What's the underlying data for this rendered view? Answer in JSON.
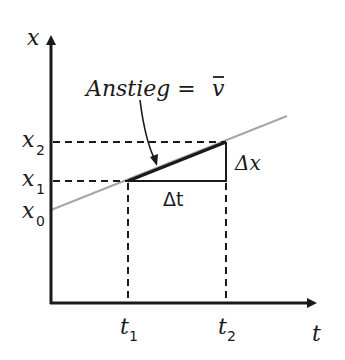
{
  "diagram": {
    "type": "position-time graph",
    "axes": {
      "y_label": "x",
      "x_label": "t"
    },
    "y_ticks": [
      {
        "label": "x",
        "sub": "2"
      },
      {
        "label": "x",
        "sub": "1"
      },
      {
        "label": "x",
        "sub": "0"
      }
    ],
    "x_ticks": [
      {
        "label": "t",
        "sub": "1"
      },
      {
        "label": "t",
        "sub": "2"
      }
    ],
    "annotation": {
      "text": "Anstieg = ",
      "symbol": "v",
      "bar": "¯"
    },
    "delta_x_label": "Δx",
    "delta_t_label": "Δt",
    "colors": {
      "axis": "#1a1a1a",
      "line": "#a6a6a6",
      "secant": "#1a1a1a",
      "background": "#ffffff"
    }
  }
}
